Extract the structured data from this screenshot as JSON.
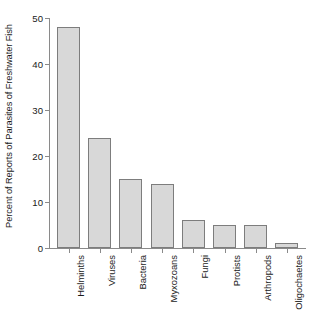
{
  "chart_data": {
    "type": "bar",
    "title": "",
    "subtitle": "",
    "xlabel": "",
    "ylabel": "Percent of Reports of Parasites of Freshwater Fish",
    "categories": [
      "Helminths",
      "Viruses",
      "Bacteria",
      "Myxozoans",
      "Fungi",
      "Protists",
      "Arthropods",
      "Oligochaetes"
    ],
    "values": [
      48,
      24,
      15,
      14,
      6,
      5,
      5,
      1
    ],
    "ylim": [
      0,
      50
    ],
    "ytick_labels": [
      "0",
      "10",
      "20",
      "30",
      "40",
      "50"
    ],
    "ytick_values": [
      0,
      10,
      20,
      30,
      40,
      50
    ],
    "grid": false,
    "legend": false,
    "legend_position": "none",
    "bar_fill_color": "#d8d8d8",
    "bar_border_color": "#7d7d7d",
    "axis_color": "#8a8a8a",
    "background_color": "#ffffff",
    "text_color": "#1a1a1a"
  }
}
